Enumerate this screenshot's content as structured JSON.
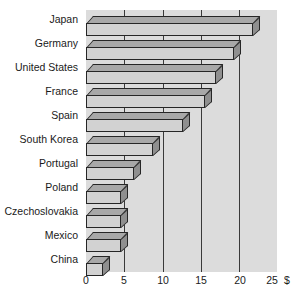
{
  "chart_data": {
    "type": "bar",
    "orientation": "horizontal",
    "title": "",
    "subtitle": "",
    "xlabel": "$",
    "ylabel": "",
    "categories": [
      "Japan",
      "Germany",
      "United States",
      "France",
      "Spain",
      "South Korea",
      "Portugal",
      "Poland",
      "Czechoslovakia",
      "Mexico",
      "China"
    ],
    "values": [
      21.8,
      19.4,
      17.0,
      15.5,
      12.7,
      8.8,
      6.3,
      4.6,
      4.6,
      4.6,
      2.2
    ],
    "xlim": [
      0,
      25
    ],
    "xticks": [
      0,
      5,
      10,
      15,
      20,
      25
    ],
    "xtick_labels": [
      "0",
      "5",
      "10",
      "15",
      "20",
      "25"
    ],
    "currency_symbol": "$",
    "grid": "vertical-only",
    "legend": "none",
    "style": "3d-isometric-bars",
    "colors": {
      "plot_background": "#dcdcdc",
      "page_background": "#ffffff",
      "gridline": "#3a3a3a",
      "bar_face": "#d2d2d2",
      "bar_top": "#a8a8a8",
      "bar_side": "#8f8f8f",
      "bar_outline": "#262626",
      "text": "#1a1a1a"
    }
  }
}
